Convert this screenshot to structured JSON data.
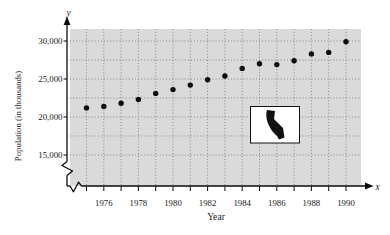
{
  "figure": {
    "x_axis_letter": "x",
    "y_axis_letter": "y",
    "x_axis_title": "Year",
    "y_axis_title": "Population (in thousands)",
    "inset_icon": "california-state-silhouette",
    "colors": {
      "plot_background": "#dadada",
      "grid": "#757575",
      "axis": "#0a0a0a",
      "marker": "#0e0e0e",
      "inset_background": "#ffffff",
      "text": "#1c1c1c"
    }
  },
  "chart_data": {
    "type": "scatter",
    "title": "",
    "xlabel": "Year",
    "ylabel": "Population (in thousands)",
    "x": [
      1975,
      1976,
      1977,
      1978,
      1979,
      1980,
      1981,
      1982,
      1983,
      1984,
      1985,
      1986,
      1987,
      1988,
      1989,
      1990
    ],
    "y": [
      21200,
      21400,
      21800,
      22300,
      23100,
      23600,
      24200,
      24900,
      25400,
      26400,
      27000,
      26900,
      27400,
      28300,
      28500,
      29900
    ],
    "x_ticks_labeled": [
      1976,
      1978,
      1980,
      1982,
      1984,
      1986,
      1988,
      1990
    ],
    "x_tick_labels": [
      "1976",
      "1978",
      "1980",
      "1982",
      "1984",
      "1986",
      "1988",
      "1990"
    ],
    "y_ticks": [
      15000,
      20000,
      25000,
      30000
    ],
    "y_tick_labels": [
      "15,000",
      "20,000",
      "25,000",
      "30,000"
    ],
    "xlim": [
      1975,
      1990
    ],
    "ylim": [
      15000,
      30000
    ],
    "x_grid_step": 1,
    "y_grid_step": 2500,
    "grid": true,
    "grid_style": "dotted",
    "axis_break": true,
    "legend": null
  }
}
